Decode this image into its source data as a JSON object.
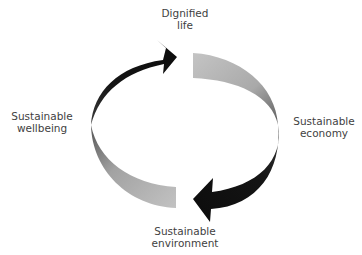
{
  "diagram": {
    "title": "",
    "type": "cycle",
    "nodes": [
      {
        "id": "top",
        "position": "top",
        "lines": [
          "Dignified",
          "life"
        ]
      },
      {
        "id": "right",
        "position": "right",
        "lines": [
          "Sustainable",
          "economy"
        ]
      },
      {
        "id": "bottom",
        "position": "bottom",
        "lines": [
          "Sustainable",
          "environment"
        ]
      },
      {
        "id": "left",
        "position": "left",
        "lines": [
          "Sustainable",
          "wellbeing"
        ]
      }
    ],
    "arrows": [
      {
        "from": "left",
        "to": "top",
        "style": "black-arrow",
        "color": "#111111"
      },
      {
        "from": "top",
        "to": "right",
        "style": "gray-ribbon",
        "color": "#a8a8a8"
      },
      {
        "from": "right",
        "to": "bottom",
        "style": "black-arrow",
        "color": "#111111"
      },
      {
        "from": "bottom",
        "to": "left",
        "style": "gray-ribbon",
        "color": "#a8a8a8"
      }
    ],
    "colors": {
      "text": "#3f3f3f",
      "arrow_dark": "#111111",
      "ribbon_light": "#bdbdbd",
      "ribbon_dark": "#6a6a6a",
      "background": "#ffffff"
    }
  }
}
